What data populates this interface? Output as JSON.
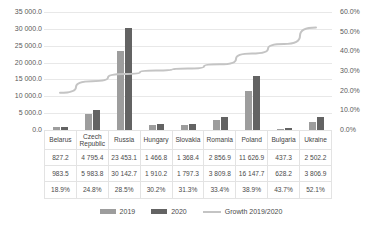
{
  "chart_data": {
    "type": "bar",
    "title": "",
    "xlabel": "",
    "ylabel": "",
    "categories": [
      "Belarus",
      "Czech Republic",
      "Russia",
      "Hungary",
      "Slovakia",
      "Romania",
      "Poland",
      "Bulgaria",
      "Ukraine"
    ],
    "series": [
      {
        "name": "2019",
        "values": [
          827.2,
          4795.4,
          23453.1,
          1466.8,
          1368.4,
          2856.9,
          11626.9,
          437.3,
          2502.2
        ],
        "labels": [
          "827.2",
          "4 795.4",
          "23 453.1",
          "1 466.8",
          "1 368.4",
          "2 856.9",
          "11 626.9",
          "437.3",
          "2 502.2"
        ],
        "color": "#9d9d9d",
        "axis": "left"
      },
      {
        "name": "2020",
        "values": [
          983.5,
          5983.8,
          30142.7,
          1910.2,
          1797.3,
          3809.8,
          16147.7,
          628.2,
          3806.9
        ],
        "labels": [
          "983.5",
          "5 983.8",
          "30 142.7",
          "1 910.2",
          "1 797.3",
          "3 809.8",
          "16 147.7",
          "628.2",
          "3 806.9"
        ],
        "color": "#636363",
        "axis": "left"
      },
      {
        "name": "Growth 2019/2020",
        "values": [
          18.9,
          24.8,
          28.5,
          30.2,
          31.3,
          33.4,
          38.9,
          43.7,
          52.1
        ],
        "labels": [
          "18.9%",
          "24.8%",
          "28.5%",
          "30.2%",
          "31.3%",
          "33.4%",
          "38.9%",
          "43.7%",
          "52.1%"
        ],
        "color": "#c4c4c4",
        "type": "line",
        "axis": "right"
      }
    ],
    "y_left": {
      "min": 0,
      "max": 35000,
      "step": 5000,
      "ticks": [
        "0.0",
        "5 000.0",
        "10 000.0",
        "15 000.0",
        "20 000.0",
        "25 000.0",
        "30 000.0",
        "35 000.0"
      ]
    },
    "y_right": {
      "min": 0,
      "max": 60,
      "step": 10,
      "ticks": [
        "0.0%",
        "10.0%",
        "20.0%",
        "30.0%",
        "40.0%",
        "50.0%",
        "60.0%"
      ]
    },
    "grid": true,
    "legend_position": "bottom"
  },
  "table": {
    "rows": [
      {
        "key": "header",
        "cells": [
          "Belarus",
          "Czech Republic",
          "Russia",
          "Hungary",
          "Slovakia",
          "Romania",
          "Poland",
          "Bulgaria",
          "Ukraine"
        ]
      },
      {
        "key": "2019",
        "cells": [
          "827.2",
          "4 795.4",
          "23 453.1",
          "1 466.8",
          "1 368.4",
          "2 856.9",
          "11 626.9",
          "437.3",
          "2 502.2"
        ]
      },
      {
        "key": "2020",
        "cells": [
          "983.5",
          "5 983.8",
          "30 142.7",
          "1 910.2",
          "1 797.3",
          "3 809.8",
          "16 147.7",
          "628.2",
          "3 806.9"
        ]
      },
      {
        "key": "growth",
        "cells": [
          "18.9%",
          "24.8%",
          "28.5%",
          "30.2%",
          "31.3%",
          "33.4%",
          "38.9%",
          "43.7%",
          "52.1%"
        ]
      }
    ]
  },
  "legend": {
    "items": [
      {
        "label": "2019",
        "marker": "bar-swatch-2019"
      },
      {
        "label": "2020",
        "marker": "bar-swatch-2020"
      },
      {
        "label": "Growth 2019/2020",
        "marker": "line-swatch-growth"
      }
    ]
  }
}
